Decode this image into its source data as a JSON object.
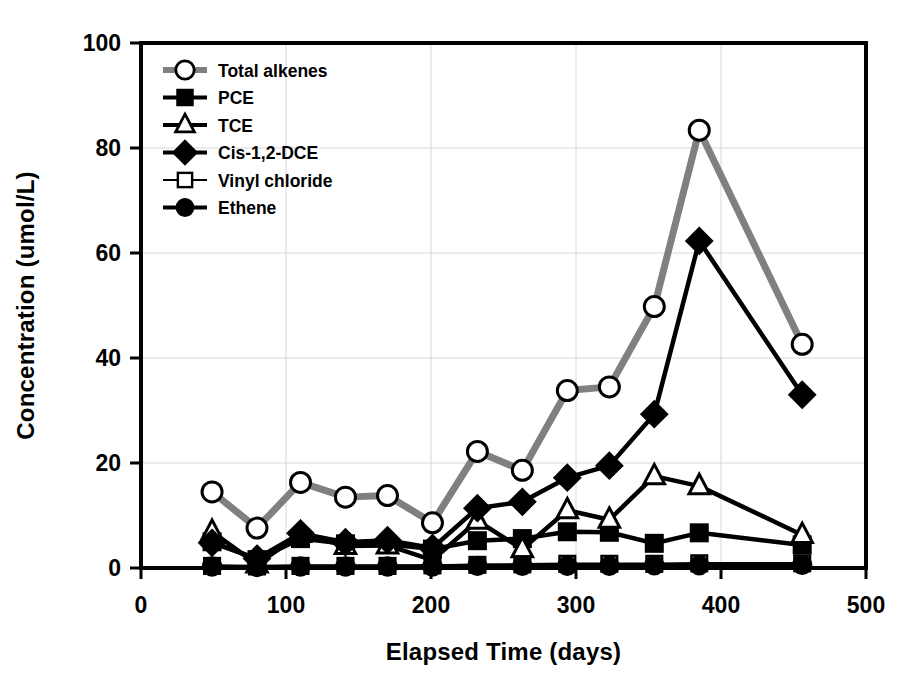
{
  "chart_data": {
    "type": "line",
    "title": "",
    "xlabel": "Elapsed Time (days)",
    "ylabel": "Concentration (umol/L)",
    "xlim": [
      0,
      500
    ],
    "ylim": [
      0,
      100
    ],
    "xticks": [
      "0",
      "100",
      "200",
      "300",
      "400",
      "500"
    ],
    "yticks": [
      "0",
      "20",
      "40",
      "60",
      "80",
      "100"
    ],
    "grid": true,
    "legend_position": "upper-left-inside",
    "x": [
      49,
      80,
      110,
      141,
      170,
      201,
      232,
      263,
      294,
      323,
      354,
      385,
      456
    ],
    "series": [
      {
        "name": "Total alkenes",
        "marker": "open-circle",
        "line_color": "#808080",
        "values": [
          14.5,
          7.6,
          16.3,
          13.5,
          13.8,
          8.6,
          22.2,
          18.6,
          33.8,
          34.5,
          49.8,
          83.4,
          42.6
        ]
      },
      {
        "name": "PCE",
        "marker": "filled-square",
        "line_color": "#000000",
        "values": [
          5.0,
          1.6,
          5.6,
          4.6,
          4.5,
          3.6,
          5.2,
          5.6,
          6.9,
          6.8,
          4.7,
          6.7,
          4.4
        ]
      },
      {
        "name": "TCE",
        "marker": "open-triangle",
        "line_color": "#000000",
        "values": [
          6.9,
          0.7,
          6.5,
          4.2,
          4.3,
          1.5,
          9.0,
          3.6,
          11.0,
          9.2,
          17.5,
          15.6,
          6.3
        ]
      },
      {
        "name": "Cis-1,2-DCE",
        "marker": "filled-diamond",
        "line_color": "#000000",
        "values": [
          4.8,
          1.8,
          6.6,
          4.9,
          5.3,
          3.8,
          11.4,
          12.6,
          17.2,
          19.5,
          29.3,
          62.3,
          33.0
        ]
      },
      {
        "name": "Vinyl chloride",
        "marker": "open-square",
        "line_color": "#000000",
        "values": [
          0.4,
          0.3,
          0.4,
          0.4,
          0.4,
          0.5,
          0.6,
          0.7,
          0.8,
          0.8,
          0.8,
          0.9,
          0.9
        ]
      },
      {
        "name": "Ethene",
        "marker": "filled-circle",
        "line_color": "#000000",
        "values": [
          0.3,
          0.2,
          0.3,
          0.3,
          0.3,
          0.3,
          0.4,
          0.4,
          0.4,
          0.4,
          0.5,
          0.5,
          0.6
        ]
      }
    ]
  },
  "axes": {
    "x_title": "Elapsed Time (days)",
    "y_title": "Concentration (umol/L)",
    "x_tick_labels": [
      "0",
      "100",
      "200",
      "300",
      "400",
      "500"
    ],
    "y_tick_labels": [
      "0",
      "20",
      "40",
      "60",
      "80",
      "100"
    ]
  },
  "legend": {
    "items": [
      {
        "label": "Total alkenes",
        "marker": "open-circle",
        "color": "#808080"
      },
      {
        "label": "PCE",
        "marker": "filled-square",
        "color": "#000000"
      },
      {
        "label": "TCE",
        "marker": "open-triangle",
        "color": "#000000"
      },
      {
        "label": "Cis-1,2-DCE",
        "marker": "filled-diamond",
        "color": "#000000"
      },
      {
        "label": "Vinyl chloride",
        "marker": "open-square",
        "color": "#000000"
      },
      {
        "label": "Ethene",
        "marker": "filled-circle",
        "color": "#000000"
      }
    ]
  }
}
